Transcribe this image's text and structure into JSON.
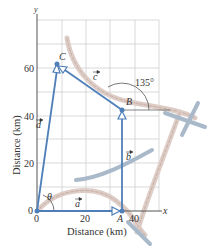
{
  "figure": {
    "x_axis_label": "Distance (km)",
    "y_axis_label": "Distance (km)",
    "x_axis_name": "x",
    "y_axis_name": "y",
    "x_ticks": [
      "0",
      "20",
      "40"
    ],
    "y_ticks": [
      "0",
      "20",
      "40",
      "60"
    ],
    "points": {
      "origin": "0",
      "A": "A",
      "B": "B",
      "C": "C"
    },
    "vectors": {
      "a": "a",
      "b": "b",
      "c": "c",
      "d": "d"
    },
    "angles": {
      "theta": "θ",
      "angle_at_B": "135°"
    },
    "colors": {
      "vector": "#4f7fb8",
      "grid": "#c8c8c8",
      "axis": "#555555",
      "path_trail": "#d9c6bf",
      "path_cross": "#9fb3c8"
    }
  }
}
